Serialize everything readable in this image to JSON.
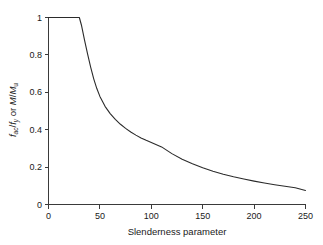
{
  "chart_data": {
    "type": "line",
    "title": "",
    "subtitle": "",
    "xlabel": "Slenderness parameter",
    "ylabel": "f_ac/f_y or M/M_u",
    "ylabel_parts": {
      "num_main": "f",
      "num_sub": "ac",
      "slash1": "/",
      "den_main": "f",
      "den_sub": "y",
      "conjunction": " or ",
      "second_num": "M",
      "slash2": "/",
      "second_den": "M",
      "second_den_sub": "u"
    },
    "xlim": [
      0,
      250
    ],
    "ylim": [
      0,
      1
    ],
    "xticks": [
      0,
      50,
      100,
      150,
      200,
      250
    ],
    "yticks": [
      0,
      0.2,
      0.4,
      0.6,
      0.8,
      1
    ],
    "xticklabels": [
      "0",
      "50",
      "100",
      "150",
      "200",
      "250"
    ],
    "yticklabels": [
      "0",
      "0.2",
      "0.4",
      "0.6",
      "0.8",
      "1"
    ],
    "grid": false,
    "legend": "none",
    "series": [
      {
        "name": "strength curve",
        "color": "#2b2b2b",
        "x": [
          0,
          10,
          20,
          30,
          32,
          35,
          38,
          41,
          44,
          47,
          50,
          55,
          60,
          65,
          70,
          75,
          80,
          85,
          90,
          95,
          100,
          110,
          120,
          130,
          140,
          150,
          160,
          170,
          180,
          190,
          200,
          210,
          220,
          230,
          240,
          250
        ],
        "y": [
          1,
          1,
          1,
          1,
          0.96,
          0.88,
          0.805,
          0.735,
          0.672,
          0.62,
          0.578,
          0.525,
          0.486,
          0.455,
          0.429,
          0.407,
          0.388,
          0.371,
          0.356,
          0.343,
          0.331,
          0.308,
          0.272,
          0.242,
          0.218,
          0.197,
          0.178,
          0.162,
          0.148,
          0.136,
          0.125,
          0.115,
          0.106,
          0.098,
          0.09,
          0.075
        ]
      }
    ],
    "annotations": [
      {
        "text": "plateau at 1.0 up to slenderness 30"
      }
    ]
  },
  "axes": {
    "x_axis_name": "Slenderness parameter",
    "y_axis_name": "f_ac/f_y or M/M_u"
  },
  "colors": {
    "curve": "#2b2b2b",
    "axis": "#3a3a3a",
    "background": "#ffffff",
    "text": "#1a1a1a"
  }
}
